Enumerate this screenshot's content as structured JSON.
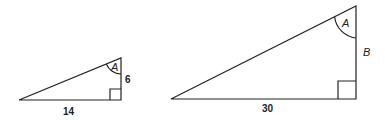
{
  "diagram": {
    "type": "similar right triangles",
    "small_triangle": {
      "base_label": "14",
      "height_label": "6",
      "angle_label": "A",
      "right_angle": true
    },
    "large_triangle": {
      "base_label": "30",
      "height_label": "B",
      "angle_label": "A",
      "right_angle": true
    },
    "colors": {
      "stroke": "#222222",
      "background": "#ffffff"
    }
  }
}
